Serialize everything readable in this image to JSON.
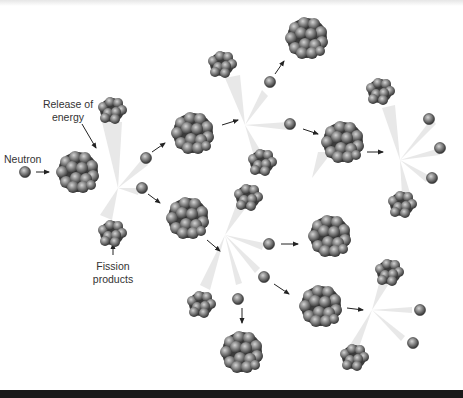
{
  "diagram": {
    "type": "nuclear-fission-chain-reaction",
    "labels": {
      "neutron": "Neutron",
      "release_line1": "Release of",
      "release_line2": "energy",
      "fission_line1": "Fission",
      "fission_line2": "products"
    },
    "colors": {
      "background": "#ffffff",
      "particle_dark": "#3a3a3a",
      "particle_light": "#bdbdbd",
      "arrow": "#222222",
      "energy_glow": "#d9d9d9",
      "bottom_bar": "#1a1a1a"
    },
    "stages": [
      {
        "name": "initial",
        "neutrons": 1,
        "nucleus": "large"
      },
      {
        "name": "generation-1",
        "fission_products": 2,
        "neutrons_released": 2
      },
      {
        "name": "generation-2",
        "fissions": 2,
        "neutrons_released": 6
      },
      {
        "name": "generation-3",
        "fissions": 3
      }
    ]
  }
}
